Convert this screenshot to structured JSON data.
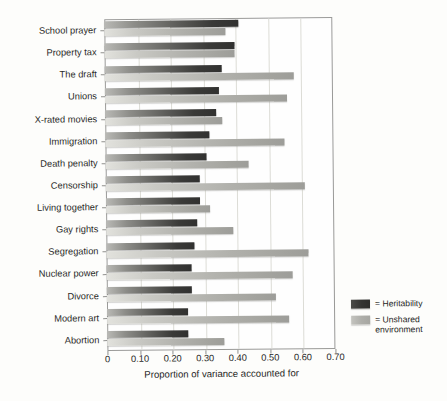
{
  "chart_data": {
    "type": "bar",
    "orientation": "horizontal",
    "title": "",
    "xlabel": "Proportion of variance accounted for",
    "ylabel": "",
    "xlim": [
      0,
      0.7
    ],
    "xticks": [
      0,
      0.1,
      0.2,
      0.3,
      0.4,
      0.5,
      0.6,
      0.7
    ],
    "xtick_labels": [
      "0",
      "0.10",
      "0.20",
      "0.30",
      "0.40",
      "0.50",
      "0.60",
      "0.70"
    ],
    "grid": true,
    "grid_axis": "x",
    "legend_position": "right",
    "categories": [
      "School prayer",
      "Property tax",
      "The draft",
      "Unions",
      "X-rated movies",
      "Immigration",
      "Death penalty",
      "Censorship",
      "Living together",
      "Gay rights",
      "Segregation",
      "Nuclear power",
      "Divorce",
      "Modern art",
      "Abortion"
    ],
    "series": [
      {
        "name": "Heritability",
        "color": "#333331",
        "values": [
          0.41,
          0.4,
          0.36,
          0.35,
          0.34,
          0.32,
          0.31,
          0.29,
          0.29,
          0.28,
          0.27,
          0.26,
          0.26,
          0.25,
          0.25
        ]
      },
      {
        "name": "Unshared environment",
        "color": "#aeaea9",
        "values": [
          0.37,
          0.4,
          0.58,
          0.56,
          0.36,
          0.55,
          0.44,
          0.61,
          0.32,
          0.39,
          0.62,
          0.57,
          0.52,
          0.56,
          0.36
        ]
      }
    ]
  },
  "legend": {
    "items": [
      {
        "marker": "dark-swatch",
        "label": "= Heritability"
      },
      {
        "marker": "light-swatch",
        "label": "= Unshared\nenvironment"
      }
    ]
  },
  "axis": {
    "x_title": "Proportion of variance accounted for"
  }
}
